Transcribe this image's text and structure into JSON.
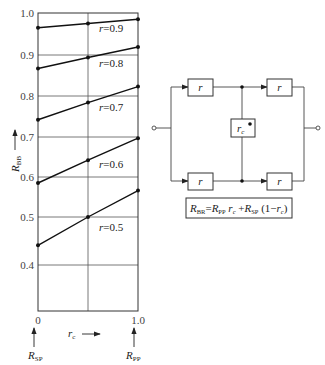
{
  "chart_data": {
    "type": "line",
    "title": "",
    "xlabel": "r_c",
    "ylabel": "R_BB",
    "x": [
      0,
      0.5,
      1.0
    ],
    "x_tick_labels": [
      "0",
      "1.0"
    ],
    "y_tick_labels": [
      "1.0",
      "0.9",
      "0.8",
      "0.7",
      "0.6",
      "0.5",
      "0.4"
    ],
    "ylim": [
      0.3,
      1.0
    ],
    "xlim": [
      0,
      1.0
    ],
    "grid": true,
    "x_endpoint_labels": {
      "left": "R_SP",
      "right": "R_PP"
    },
    "series": [
      {
        "name": "r =0.9",
        "values": [
          0.965,
          0.975,
          0.985
        ]
      },
      {
        "name": "r =0.8",
        "values": [
          0.867,
          0.894,
          0.919
        ]
      },
      {
        "name": "r =0.7",
        "values": [
          0.742,
          0.784,
          0.823
        ]
      },
      {
        "name": "r =0.6",
        "values": [
          0.585,
          0.642,
          0.697
        ]
      },
      {
        "name": "r =0.5",
        "values": [
          0.441,
          0.5,
          0.566
        ]
      }
    ]
  },
  "labels": {
    "y_axis": "R",
    "y_axis_sub": "BB",
    "x_axis": "r",
    "x_axis_sub": "c",
    "x_left": "0",
    "x_right": "1.0",
    "rsp": "R",
    "rsp_sub": "SP",
    "rpp": "R",
    "rpp_sub": "PP",
    "series_prefix": "r",
    "series_values": [
      "=0.9",
      "=0.8",
      "=0.7",
      "=0.6",
      "=0.5"
    ]
  },
  "diagram": {
    "box_top_left": "r",
    "box_top_right": "r",
    "box_bottom_left": "r",
    "box_bottom_right": "r",
    "box_center": "r",
    "box_center_sub": "c",
    "formula": {
      "lhs": "R",
      "lhs_sub": "BR",
      "eq": "=",
      "t1": "R",
      "t1_sub": "PP",
      "t1_mul": " r",
      "t1_mul_sub": "c",
      "plus": " +",
      "t2": "R",
      "t2_sub": "SP",
      "t2_rest": " (1−",
      "t2_r": "r",
      "t2_r_sub": "c",
      "close": ")"
    }
  }
}
